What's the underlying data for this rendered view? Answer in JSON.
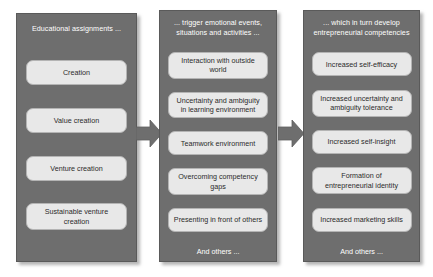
{
  "diagram": {
    "colors": {
      "panel_background": "#6e6e6e",
      "panel_border": "#5a5a5a",
      "card_background": "#e8e8e8",
      "card_border": "#b4b4b4",
      "header_text": "#ffffff",
      "card_text": "#2b2b2b",
      "arrow_fill": "#6e6e6e",
      "page_background": "#ffffff"
    },
    "panels": [
      {
        "id": "educational-assignments",
        "header": "Educational assignments ...",
        "cards": [
          "Creation",
          "Value creation",
          "Venture creation",
          "Sustainable venture creation"
        ],
        "footnote": ""
      },
      {
        "id": "emotional-events",
        "header": "... trigger emotional events, situations and activities ...",
        "cards": [
          "Interaction with outside world",
          "Uncertainty and ambiguity in learning environment",
          "Teamwork environment",
          "Overcoming competency gaps",
          "Presenting in front of others"
        ],
        "footnote": "And others ..."
      },
      {
        "id": "entrepreneurial-competencies",
        "header": "... which in turn develop entrepreneurial competencies",
        "cards": [
          "Increased self-efficacy",
          "Increased uncertainty and ambiguity tolerance",
          "Increased self-insight",
          "Formation of entrepreneurial identity",
          "Increased marketing skills"
        ],
        "footnote": "And others ..."
      }
    ],
    "arrows": [
      {
        "id": "arrow-panel1-to-panel2",
        "direction": "right"
      },
      {
        "id": "arrow-panel2-to-panel3",
        "direction": "right"
      }
    ]
  }
}
